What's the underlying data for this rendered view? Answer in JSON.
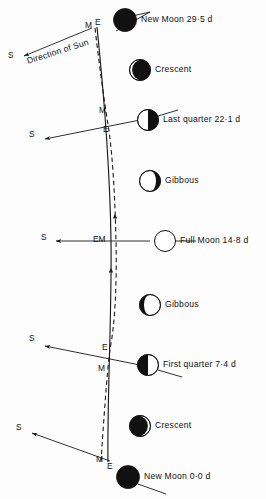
{
  "figure": {
    "sun_direction_label": "Direction of Sun",
    "earth_symbol": "E",
    "moon_symbol": "M",
    "sun_symbol": "S",
    "caption": ""
  },
  "colors": {
    "line": "#1a1a1a",
    "dark_limb": "#111111",
    "light_limb": "#ffffff",
    "text": "#111111",
    "background": "#fdfdfd"
  },
  "phases": [
    {
      "id": "new-moon-top",
      "label": "New Moon 29·5 d",
      "phase": "new",
      "age_days": 29.5,
      "icon": "moon-new-icon",
      "cx": 125,
      "cy": 20,
      "r": 11.5,
      "label_x": 141,
      "label_y": 15
    },
    {
      "id": "crescent-top",
      "label": "Crescent",
      "phase": "waning-crescent",
      "age_days": 26,
      "icon": "moon-waning-crescent-icon",
      "cx": 140,
      "cy": 70,
      "r": 10.5,
      "label_x": 155,
      "label_y": 65
    },
    {
      "id": "last-quarter",
      "label": "Last quarter 22·1 d",
      "phase": "last-quarter",
      "age_days": 22.1,
      "icon": "moon-last-quarter-icon",
      "cx": 148,
      "cy": 120,
      "r": 10.5,
      "label_x": 163,
      "label_y": 115
    },
    {
      "id": "gibbous-top",
      "label": "Gibbous",
      "phase": "waning-gibbous",
      "age_days": 18,
      "icon": "moon-waning-gibbous-icon",
      "cx": 150,
      "cy": 181,
      "r": 10.5,
      "label_x": 165,
      "label_y": 176
    },
    {
      "id": "full-moon",
      "label": "Full Moon 14·8 d",
      "phase": "full",
      "age_days": 14.8,
      "icon": "moon-full-icon",
      "cx": 165,
      "cy": 241,
      "r": 10.5,
      "label_x": 180,
      "label_y": 236
    },
    {
      "id": "gibbous-bottom",
      "label": "Gibbous",
      "phase": "waxing-gibbous",
      "age_days": 11,
      "icon": "moon-waxing-gibbous-icon",
      "cx": 150,
      "cy": 305,
      "r": 10.5,
      "label_x": 165,
      "label_y": 300
    },
    {
      "id": "first-quarter",
      "label": "First quarter 7·4 d",
      "phase": "first-quarter",
      "age_days": 7.4,
      "icon": "moon-first-quarter-icon",
      "cx": 148,
      "cy": 365,
      "r": 10.5,
      "label_x": 163,
      "label_y": 360
    },
    {
      "id": "crescent-bottom",
      "label": "Crescent",
      "phase": "waxing-crescent",
      "age_days": 3,
      "icon": "moon-waxing-crescent-icon",
      "cx": 140,
      "cy": 426,
      "r": 10.5,
      "label_x": 155,
      "label_y": 421
    },
    {
      "id": "new-moon-bottom",
      "label": "New Moon 0·0 d",
      "phase": "new",
      "age_days": 0.0,
      "icon": "moon-new-icon",
      "cx": 128,
      "cy": 477,
      "r": 11.5,
      "label_x": 144,
      "label_y": 472
    }
  ],
  "node_labels": [
    {
      "id": "top-M",
      "text": "M",
      "x": 88,
      "y": 26
    },
    {
      "id": "top-E",
      "text": "E",
      "x": 99,
      "y": 24
    },
    {
      "id": "lq-M",
      "text": "M",
      "x": 101,
      "y": 112
    },
    {
      "id": "lq-E",
      "text": "E",
      "x": 105,
      "y": 131
    },
    {
      "id": "full-EM",
      "text": "EM",
      "x": 95,
      "y": 236
    },
    {
      "id": "fq-E",
      "text": "E",
      "x": 104,
      "y": 349
    },
    {
      "id": "fq-M",
      "text": "M",
      "x": 100,
      "y": 370
    },
    {
      "id": "bot-M",
      "text": "M",
      "x": 99,
      "y": 461
    },
    {
      "id": "bot-E",
      "text": "E",
      "x": 110,
      "y": 468
    }
  ],
  "sun_arrows": [
    {
      "id": "sun-arrow-top",
      "label": "S",
      "label_x": 8,
      "label_y": 55,
      "x1": 92,
      "y1": 28,
      "x2": 22,
      "y2": 57
    },
    {
      "id": "sun-arrow-lq",
      "label": "S",
      "label_x": 29,
      "label_y": 134,
      "x1": 140,
      "y1": 120,
      "x2": 43,
      "y2": 140
    },
    {
      "id": "sun-arrow-full",
      "label": "S",
      "label_x": 41,
      "label_y": 236,
      "x1": 150,
      "y1": 241,
      "x2": 54,
      "y2": 241
    },
    {
      "id": "sun-arrow-fq",
      "label": "S",
      "label_x": 29,
      "label_y": 338,
      "x1": 140,
      "y1": 365,
      "x2": 43,
      "y2": 345
    },
    {
      "id": "sun-arrow-bottom",
      "label": "S",
      "label_x": 16,
      "label_y": 427,
      "x1": 110,
      "y1": 461,
      "x2": 30,
      "y2": 432
    }
  ],
  "paths": {
    "earth_path_style": "solid",
    "moon_path_style": "dashed",
    "motion_arrow_direction": "upward"
  }
}
